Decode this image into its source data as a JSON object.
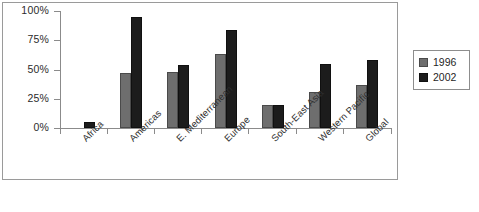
{
  "chart_data": {
    "type": "bar",
    "title": "",
    "subtitle": "",
    "xlabel": "",
    "ylabel": "",
    "ylim": [
      0,
      100
    ],
    "yticks": [
      "0%",
      "25%",
      "50%",
      "75%",
      "100%"
    ],
    "ytick_values": [
      0,
      25,
      50,
      75,
      100
    ],
    "grid": false,
    "legend_position": "right",
    "categories": [
      "Africa",
      "Americas",
      "E. Mediterranean",
      "Europe",
      "South-East Asia",
      "Western Pacific",
      "Global"
    ],
    "series": [
      {
        "name": "1996",
        "color": "#6e6e6e",
        "values": [
          0,
          47,
          48,
          63,
          20,
          31,
          37
        ]
      },
      {
        "name": "2002",
        "color": "#1c1c1c",
        "values": [
          5,
          95,
          54,
          84,
          20,
          55,
          58
        ]
      }
    ]
  },
  "legend": {
    "items": [
      {
        "label": "1996",
        "swatch": "gray-swatch"
      },
      {
        "label": "2002",
        "swatch": "black-swatch"
      }
    ]
  }
}
